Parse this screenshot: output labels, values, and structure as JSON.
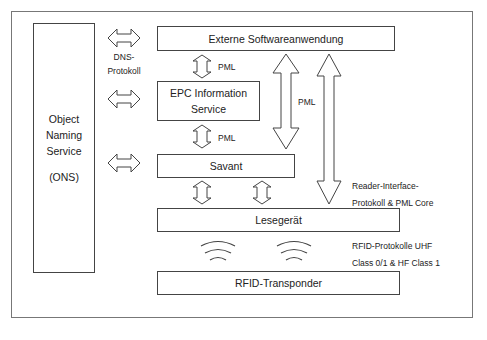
{
  "diagram": {
    "type": "architecture",
    "nodes": {
      "ons": {
        "line1": "Object",
        "line2": "Naming",
        "line3": "Service",
        "line4": "(ONS)"
      },
      "external_software": {
        "label": "Externe Softwareanwendung"
      },
      "epc_is": {
        "line1": "EPC Information",
        "line2": "Service"
      },
      "savant": {
        "label": "Savant"
      },
      "reader": {
        "label": "Lesegerät"
      },
      "transponder": {
        "label": "RFID-Transponder"
      }
    },
    "labels": {
      "dns_line1": "DNS-",
      "dns_line2": "Protokoll",
      "pml_1": "PML",
      "pml_2": "PML",
      "pml_big": "PML",
      "reader_if_line1": "Reader-Interface-",
      "reader_if_line2": "Protokoll & PML Core",
      "rfid_line1": "RFID-Protokolle UHF",
      "rfid_line2": "Class 0/1 & HF Class 1"
    },
    "edges": [
      {
        "from": "ons",
        "to": "external_software",
        "style": "double-arrow-horizontal"
      },
      {
        "from": "ons",
        "to": "epc_is",
        "style": "double-arrow-horizontal"
      },
      {
        "from": "ons",
        "to": "savant",
        "style": "double-arrow-horizontal"
      },
      {
        "from": "external_software",
        "to": "epc_is",
        "style": "double-arrow-vertical",
        "label": "PML"
      },
      {
        "from": "epc_is",
        "to": "savant",
        "style": "double-arrow-vertical",
        "label": "PML"
      },
      {
        "from": "savant",
        "to": "reader",
        "style": "double-arrow-vertical (x2)"
      },
      {
        "from": "external_software",
        "to": "savant",
        "style": "long-double-arrow",
        "label": "PML"
      },
      {
        "from": "external_software",
        "to": "reader",
        "style": "long-double-arrow"
      },
      {
        "from": "reader",
        "to": "transponder",
        "style": "radio-waves (x2)"
      }
    ]
  }
}
